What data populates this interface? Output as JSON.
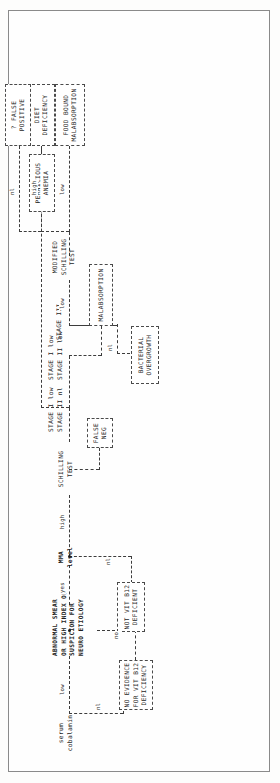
{
  "figure": {
    "type": "clinical-decision-flowchart",
    "orientation": "landscape-rotated-90ccw",
    "title_visible": false
  },
  "nodes": {
    "serum_cobalamin": {
      "lines": [
        "serum",
        "cobalamin"
      ],
      "boxed": false,
      "bold": false
    },
    "abnormal_smear": {
      "lines": [
        "ABNORMAL SMEAR",
        "OR HIGH INDEX OF",
        "SUSPICION FOR",
        "NEURO ETIOLOGY"
      ],
      "boxed": false,
      "bold": true
    },
    "no_evidence": {
      "lines": [
        "NO EVIDENCE",
        "FOR VIT B12",
        "DEFICIENCY"
      ],
      "boxed": true,
      "bold": true
    },
    "mma_level": {
      "lines": [
        "MMA",
        "level"
      ],
      "boxed": false,
      "bold": true
    },
    "not_vit_b12_deficient": {
      "lines": [
        "NOT VIT B12",
        "DEFICIENT"
      ],
      "boxed": true,
      "bold": true
    },
    "schilling_test": {
      "lines": [
        "SCHILLING",
        "TEST"
      ],
      "boxed": false,
      "bold": false
    },
    "false_neg": {
      "lines": [
        "FALSE",
        "NEG"
      ],
      "boxed": true,
      "bold": true
    },
    "bacterial_overgrowth": {
      "lines": [
        "BACTERIAL",
        "OVERGROWTH"
      ],
      "boxed": true,
      "bold": false
    },
    "malabsorption": {
      "lines": [
        "MALABSORPTION"
      ],
      "boxed": true,
      "bold": false
    },
    "pernicious_anemia": {
      "lines": [
        "PERNICIOUS",
        "ANEMIA"
      ],
      "boxed": true,
      "bold": false
    },
    "modified_schilling_test": {
      "lines": [
        "MODIFIED",
        "SCHILLING",
        "TEST"
      ],
      "boxed": false,
      "bold": false
    },
    "food_bound_malabsorption": {
      "lines": [
        "FOOD BOUND",
        "MALABSORPTION"
      ],
      "boxed": true,
      "bold": false
    },
    "diet_deficiency": {
      "lines": [
        "DIET",
        "DEFICIENCY"
      ],
      "boxed": true,
      "bold": false
    },
    "false_positive": {
      "lines": [
        "? FALSE",
        "POSITIVE"
      ],
      "boxed": true,
      "bold": false
    }
  },
  "stage_labels": {
    "s1a": "STAGE I",
    "s1a_val": "low",
    "s2a": "STAGE II",
    "s2a_val": "nl",
    "s1b": "STAGE I",
    "s1b_val": "low",
    "s2b": "STAGE II",
    "s2b_val": "low",
    "s3": "STAGE III"
  },
  "edge_labels": {
    "cobalamin_low": "low",
    "cobalamin_nl": "nl",
    "smear_no": "no",
    "smear_yes": "yes",
    "mma_nl": "nl",
    "mma_high": "high",
    "mma_high2": "high",
    "mma_nl2": "nl",
    "stage3_nl": "nl",
    "stage3_low": "low",
    "mod_low": "low",
    "mod_high": "high",
    "mod_nl": "nl"
  }
}
